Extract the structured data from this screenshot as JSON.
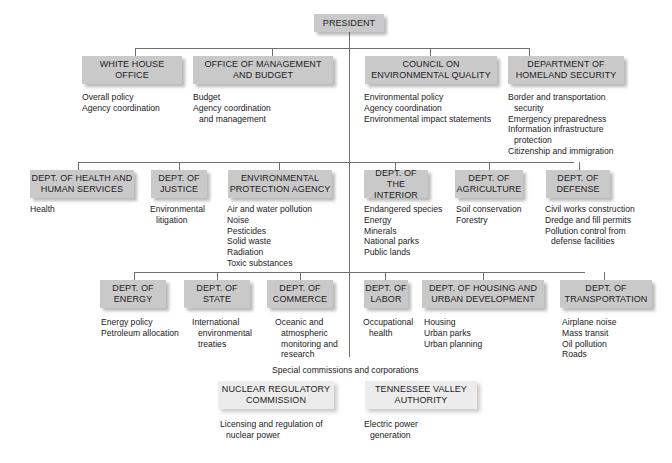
{
  "title": "PRESIDENT",
  "row1": [
    {
      "name": "WHITE HOUSE\nOFFICE",
      "lines": [
        "WHITE HOUSE",
        "OFFICE"
      ],
      "duties": [
        "Overall policy",
        "Agency coordination"
      ]
    },
    {
      "name": "OFFICE OF MANAGEMENT AND BUDGET",
      "lines": [
        "OFFICE OF MANAGEMENT",
        "AND BUDGET"
      ],
      "duties": [
        "Budget",
        "Agency coordination",
        "and management"
      ]
    },
    {
      "name": "COUNCIL ON ENVIRONMENTAL QUALITY",
      "lines": [
        "COUNCIL ON",
        "ENVIRONMENTAL QUALITY"
      ],
      "duties": [
        "Environmental policy",
        "Agency coordination",
        "Environmental impact statements"
      ]
    },
    {
      "name": "DEPARTMENT OF HOMELAND SECURITY",
      "lines": [
        "DEPARTMENT OF",
        "HOMELAND SECURITY"
      ],
      "duties": [
        "Border and transportation",
        "security",
        "Emergency preparedness",
        "Information infrastructure",
        "protection",
        "Citizenship and immigration"
      ]
    }
  ],
  "row2": [
    {
      "lines": [
        "DEPT. OF HEALTH AND",
        "HUMAN SERVICES"
      ],
      "duties": [
        "Health"
      ]
    },
    {
      "lines": [
        "DEPT. OF",
        "JUSTICE"
      ],
      "duties": [
        "Environmental",
        "litigation"
      ]
    },
    {
      "lines": [
        "ENVIRONMENTAL",
        "PROTECTION AGENCY"
      ],
      "duties": [
        "Air and water pollution",
        "Noise",
        "Pesticides",
        "Solid waste",
        "Radiation",
        "Toxic substances"
      ]
    },
    {
      "lines": [
        "DEPT. OF",
        "THE INTERIOR"
      ],
      "duties": [
        "Endangered species",
        "Energy",
        "Minerals",
        "National parks",
        "Public lands"
      ]
    },
    {
      "lines": [
        "DEPT. OF",
        "AGRICULTURE"
      ],
      "duties": [
        "Soil conservation",
        "Forestry"
      ]
    },
    {
      "lines": [
        "DEPT. OF",
        "DEFENSE"
      ],
      "duties": [
        "Civil works construction",
        "Dredge and fill permits",
        "Pollution control from",
        "defense facilities"
      ]
    }
  ],
  "row3": [
    {
      "lines": [
        "DEPT. OF",
        "ENERGY"
      ],
      "duties": [
        "Energy policy",
        "Petroleum allocation"
      ]
    },
    {
      "lines": [
        "DEPT. OF",
        "STATE"
      ],
      "duties": [
        "International",
        "environmental",
        "treaties"
      ]
    },
    {
      "lines": [
        "DEPT. OF",
        "COMMERCE"
      ],
      "duties": [
        "Oceanic and",
        "atmospheric",
        "monitoring and",
        "research"
      ]
    },
    {
      "lines": [
        "DEPT. OF",
        "LABOR"
      ],
      "duties": [
        "Occupational",
        "health"
      ]
    },
    {
      "lines": [
        "DEPT. OF HOUSING AND",
        "URBAN DEVELOPMENT"
      ],
      "duties": [
        "Housing",
        "Urban parks",
        "Urban planning"
      ]
    },
    {
      "lines": [
        "DEPT. OF",
        "TRANSPORTATION"
      ],
      "duties": [
        "Airplane noise",
        "Mass transit",
        "Oil pollution",
        "Roads"
      ]
    }
  ],
  "special_caption": "Special commissions and corporations",
  "row4": [
    {
      "lines": [
        "NUCLEAR REGULATORY",
        "COMMISSION"
      ],
      "duties": [
        "Licensing and regulation of",
        "nuclear power"
      ]
    },
    {
      "lines": [
        "TENNESSEE VALLEY",
        "AUTHORITY"
      ],
      "duties": [
        "Electric power",
        "generation"
      ]
    }
  ],
  "colors": {
    "box_dark": "#c9c9c9",
    "box_light": "#ececec",
    "line": "#6e6e6e",
    "text": "#222222"
  }
}
